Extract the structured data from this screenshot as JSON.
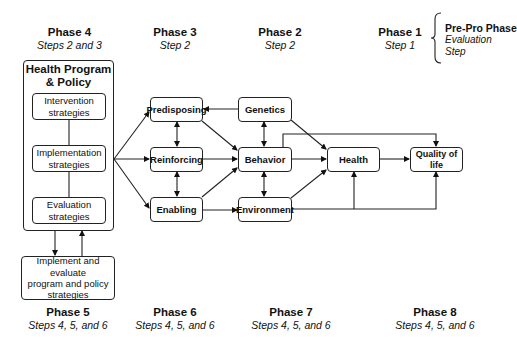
{
  "phases_top": [
    {
      "id": "phase4",
      "title": "Phase 4",
      "steps": "Steps 2 and 3"
    },
    {
      "id": "phase3",
      "title": "Phase 3",
      "steps": "Step 2"
    },
    {
      "id": "phase2",
      "title": "Phase 2",
      "steps": "Step 2"
    },
    {
      "id": "phase1",
      "title": "Phase 1",
      "steps": "Step 1"
    }
  ],
  "pre_pro": {
    "title": "Pre-Pro Phase",
    "line1": "Evaluation",
    "line2": "Step"
  },
  "phases_bottom": [
    {
      "id": "phase5",
      "title": "Phase 5",
      "steps": "Steps 4, 5, and 6"
    },
    {
      "id": "phase6",
      "title": "Phase 6",
      "steps": "Steps 4, 5, and 6"
    },
    {
      "id": "phase7",
      "title": "Phase 7",
      "steps": "Steps 4, 5, and 6"
    },
    {
      "id": "phase8",
      "title": "Phase 8",
      "steps": "Steps 4, 5, and 6"
    }
  ],
  "program": {
    "title_line1": "Health Program",
    "title_line2": "& Policy",
    "intervention": {
      "line1": "Intervention",
      "line2": "strategies"
    },
    "implementation": {
      "line1": "Implementation",
      "line2": "strategies"
    },
    "evaluation": {
      "line1": "Evaluation",
      "line2": "strategies"
    }
  },
  "implement_box": {
    "line1": "Implement and evaluate",
    "line2": "program and policy",
    "line3": "strategies"
  },
  "nodes": {
    "predisposing": "Predisposing",
    "reinforcing": "Reinforcing",
    "enabling": "Enabling",
    "genetics": "Genetics",
    "behavior": "Behavior",
    "environment": "Environment",
    "health": "Health",
    "quality_of_life": "Quality of life"
  },
  "edges": [
    {
      "from": "implementation",
      "to": "predisposing"
    },
    {
      "from": "implementation",
      "to": "reinforcing"
    },
    {
      "from": "implementation",
      "to": "enabling"
    },
    {
      "from": "genetics",
      "to": "predisposing"
    },
    {
      "from": "predisposing",
      "to": "reinforcing",
      "bidirectional": true
    },
    {
      "from": "reinforcing",
      "to": "enabling",
      "bidirectional": true
    },
    {
      "from": "predisposing",
      "to": "behavior"
    },
    {
      "from": "reinforcing",
      "to": "behavior"
    },
    {
      "from": "enabling",
      "to": "behavior"
    },
    {
      "from": "enabling",
      "to": "environment"
    },
    {
      "from": "genetics",
      "to": "behavior",
      "bidirectional": true
    },
    {
      "from": "behavior",
      "to": "environment",
      "bidirectional": true
    },
    {
      "from": "genetics",
      "to": "health"
    },
    {
      "from": "behavior",
      "to": "health"
    },
    {
      "from": "environment",
      "to": "health"
    },
    {
      "from": "behavior",
      "to": "quality_of_life"
    },
    {
      "from": "health",
      "to": "quality_of_life"
    },
    {
      "from": "environment",
      "to": "quality_of_life"
    },
    {
      "from": "program",
      "to": "implement_box"
    },
    {
      "from": "implement_box",
      "to": "program"
    }
  ]
}
